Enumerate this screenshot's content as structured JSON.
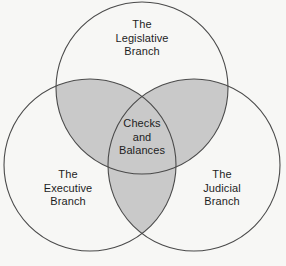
{
  "diagram": {
    "type": "venn-3-circle",
    "background_color": "#f7f7f5",
    "stroke_color": "#4a4a4a",
    "overlap_fill_color": "#c9c9c9",
    "text_color": "#1d1d1d",
    "sets": [
      {
        "id": "legislative",
        "label": "The\nLegislative\nBranch",
        "position": "top",
        "center": {
          "x": 142,
          "y": 88
        },
        "radius": 86
      },
      {
        "id": "executive",
        "label": "The\nExecutive\nBranch",
        "position": "bottom-left",
        "center": {
          "x": 90,
          "y": 165
        },
        "radius": 86
      },
      {
        "id": "judicial",
        "label": "The\nJudicial\nBranch",
        "position": "bottom-right",
        "center": {
          "x": 194,
          "y": 165
        },
        "radius": 86
      }
    ],
    "intersection": {
      "id": "checks-and-balances",
      "label": "Checks\nand\nBalances",
      "shaded": true,
      "members": [
        "legislative",
        "executive",
        "judicial"
      ]
    }
  }
}
